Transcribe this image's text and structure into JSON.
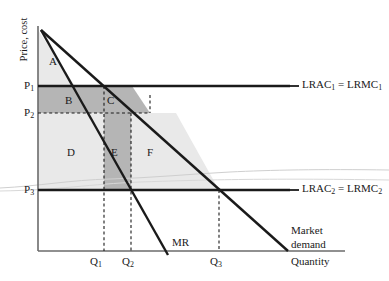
{
  "figure": {
    "type": "economics-diagram",
    "title_axes": {
      "y_axis_label": "Price, cost",
      "x_axis_label": "Quantity"
    },
    "price_ticks": [
      {
        "id": "P1",
        "label": "P",
        "sub": "1",
        "y": 86
      },
      {
        "id": "P2",
        "label": "P",
        "sub": "2",
        "y": 113
      },
      {
        "id": "P3",
        "label": "P",
        "sub": "3",
        "y": 190
      }
    ],
    "quantity_ticks": [
      {
        "id": "Q1",
        "label": "Q",
        "sub": "1",
        "x": 104
      },
      {
        "id": "Q2",
        "label": "Q",
        "sub": "2",
        "x": 131
      },
      {
        "id": "Q3",
        "label": "Q",
        "sub": "3",
        "x": 219
      }
    ],
    "curve_labels": [
      {
        "id": "lrac1",
        "text": "LRAC",
        "sub": "1",
        "text2": " = LRMC",
        "sub2": "1"
      },
      {
        "id": "lrac2",
        "text": "LRAC",
        "sub": "2",
        "text2": " = LRMC",
        "sub2": "2"
      },
      {
        "id": "mr",
        "text": "MR"
      },
      {
        "id": "demand_line1",
        "text": "Market"
      },
      {
        "id": "demand_line2",
        "text": "demand"
      }
    ],
    "regions": [
      {
        "id": "A",
        "label": "A",
        "shade": "light",
        "x": 52,
        "y": 61
      },
      {
        "id": "B",
        "label": "B",
        "shade": "dark",
        "x": 68,
        "y": 100
      },
      {
        "id": "C",
        "label": "C",
        "shade": "dark",
        "x": 110,
        "y": 100
      },
      {
        "id": "D",
        "label": "D",
        "shade": "light",
        "x": 70,
        "y": 152
      },
      {
        "id": "E",
        "label": "E",
        "shade": "dark",
        "x": 114,
        "y": 152
      },
      {
        "id": "F",
        "label": "F",
        "shade": "light",
        "x": 150,
        "y": 152
      }
    ],
    "colors": {
      "shade_light": "#e9e9e9",
      "shade_dark": "#b5b5b5",
      "line_dark": "#1a1a1a",
      "axis": "#5a5a5a",
      "faint_curve": "#c9c9c9"
    }
  }
}
